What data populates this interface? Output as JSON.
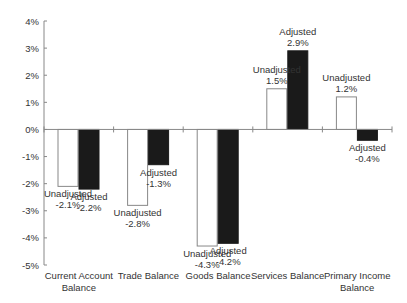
{
  "chart_data": {
    "type": "bar",
    "title": "",
    "xlabel": "",
    "ylabel": "",
    "ylim": [
      -5,
      4
    ],
    "yticks": [
      "4%",
      "3%",
      "2%",
      "1%",
      "0%",
      "-1%",
      "-2%",
      "-3%",
      "-4%",
      "-5%"
    ],
    "grid": false,
    "legend": "none (inline data labels)",
    "categories": [
      [
        "Current Account",
        "Balance"
      ],
      [
        "Trade Balance"
      ],
      [
        "Goods Balance"
      ],
      [
        "Services Balance"
      ],
      [
        "Primary Income",
        "Balance"
      ]
    ],
    "series": [
      {
        "name": "Unadjusted",
        "color": "#ffffff",
        "border": "#888888",
        "values": [
          -2.1,
          -2.8,
          -4.3,
          1.5,
          1.2
        ],
        "labels": [
          "-2.1%",
          "-2.8%",
          "-4.3%",
          "1.5%",
          "1.2%"
        ]
      },
      {
        "name": "Adjusted",
        "color": "#1a1a1a",
        "border": "#1a1a1a",
        "values": [
          -2.2,
          -1.3,
          -4.2,
          2.9,
          -0.4
        ],
        "labels": [
          "-2.2%",
          "-1.3%",
          "-4.2%",
          "2.9%",
          "-0.4%"
        ]
      }
    ]
  }
}
